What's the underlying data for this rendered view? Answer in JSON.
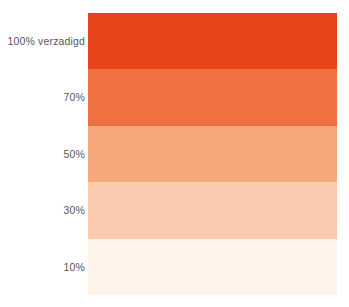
{
  "chart_data": {
    "type": "bar",
    "title": "",
    "subtitle": "",
    "xlabel": "",
    "ylabel": "",
    "orientation": "horizontal-bands",
    "legend_position": "left",
    "grid": false,
    "categories": [
      "100% verzadigd",
      "70%",
      "50%",
      "30%",
      "10%"
    ],
    "values": [
      100,
      70,
      50,
      30,
      10
    ],
    "colors": [
      "#E8431A",
      "#EF7040",
      "#F7A87B",
      "#FACBAF",
      "#FDF3E8"
    ],
    "ylim": [
      0,
      100
    ]
  },
  "swatches": [
    {
      "label": "100% verzadigd",
      "value": 100,
      "color": "#E8431A"
    },
    {
      "label": "70%",
      "value": 70,
      "color": "#EF7040"
    },
    {
      "label": "50%",
      "value": 50,
      "color": "#F7A87B"
    },
    {
      "label": "30%",
      "value": 30,
      "color": "#FACBAF"
    },
    {
      "label": "10%",
      "value": 10,
      "color": "#FDF3E8"
    }
  ],
  "style": {
    "background": "#FFFFFF",
    "label_color": "#575757",
    "accent": "#E8431A"
  }
}
